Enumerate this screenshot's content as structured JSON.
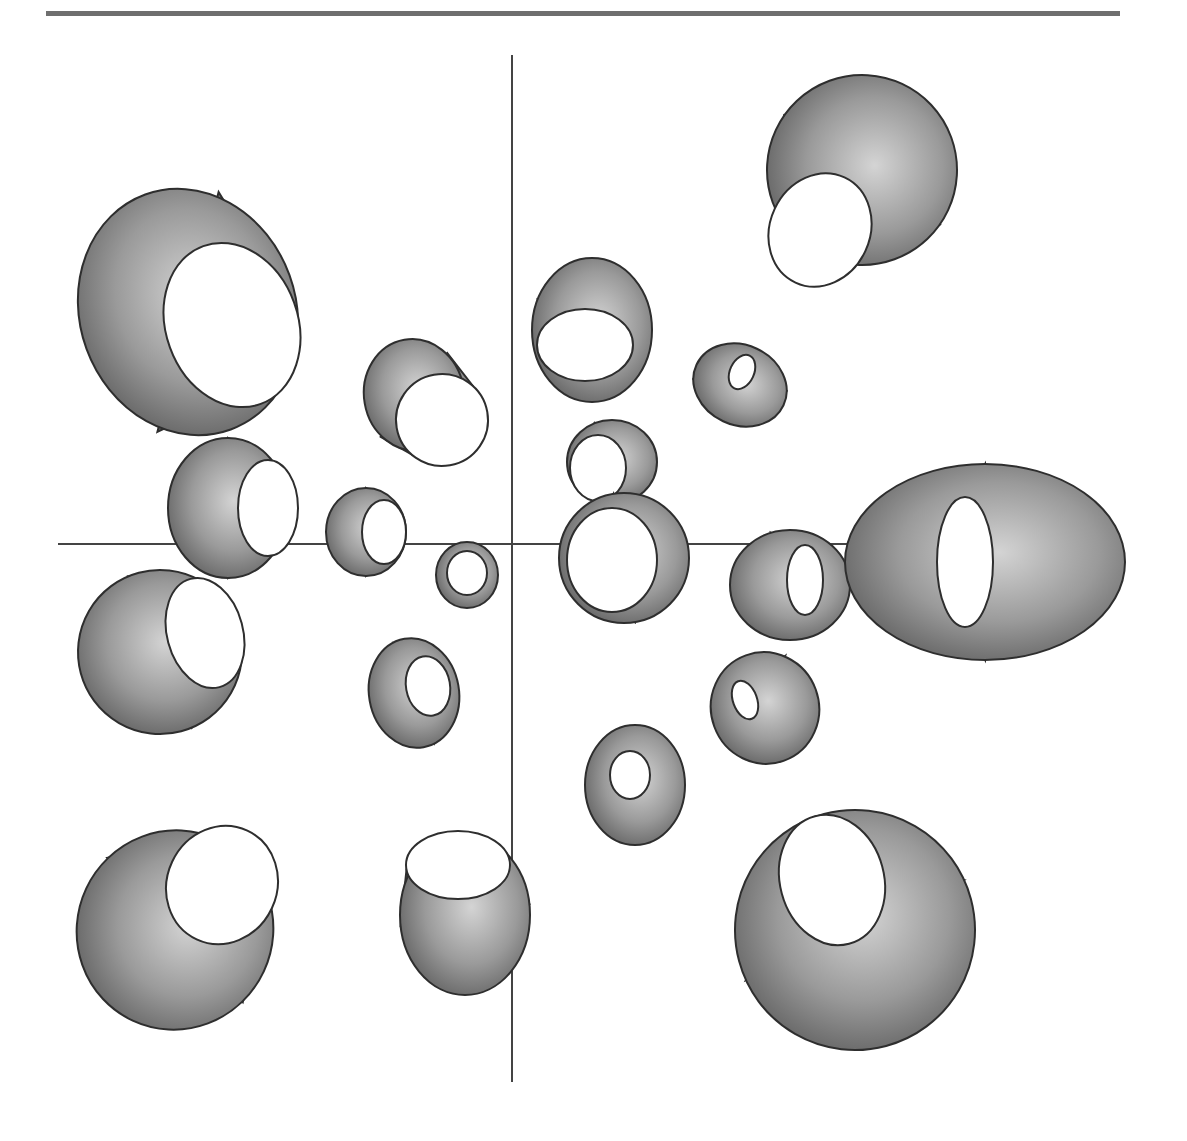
{
  "figure": {
    "width": 1187,
    "height": 1141,
    "background": "#ffffff",
    "stroke_color": "#2e2e2e",
    "hole_color": "#ffffff",
    "shade_light": "#d4d4d4",
    "shade_mid": "#9a9a9a",
    "shade_dark": "#5a5a5a",
    "top_rule": {
      "x": 46,
      "y": 11,
      "width": 1074,
      "height": 5,
      "color": "#6f6f6f"
    },
    "axes": {
      "color": "#444444",
      "vertical": {
        "x": 512,
        "y1": 55,
        "y2": 1082
      },
      "horizontal": {
        "y": 544,
        "x1": 58,
        "x2": 1000
      }
    }
  },
  "tubes": [
    {
      "name": "tube-top-left-large",
      "far": [
        188,
        312,
        108,
        125
      ],
      "near": [
        232,
        325,
        66,
        84
      ],
      "rot": -20
    },
    {
      "name": "tube-upper-left-mid",
      "far": [
        414,
        395,
        50,
        56
      ],
      "near": [
        442,
        420,
        46,
        46
      ],
      "rot": -10
    },
    {
      "name": "tube-left-upper-axis",
      "far": [
        228,
        508,
        60,
        70
      ],
      "near": [
        268,
        508,
        30,
        48
      ],
      "rot": 0
    },
    {
      "name": "tube-left-axis-small",
      "far": [
        366,
        532,
        40,
        44
      ],
      "near": [
        384,
        532,
        22,
        32
      ],
      "rot": 0
    },
    {
      "name": "tube-center-tiny",
      "far": [
        467,
        575,
        31,
        33
      ],
      "near": [
        467,
        573,
        20,
        22
      ],
      "rot": 0
    },
    {
      "name": "tube-left-lower",
      "far": [
        160,
        652,
        82,
        82
      ],
      "near": [
        205,
        633,
        38,
        56
      ],
      "rot": -15
    },
    {
      "name": "tube-lower-left-mid",
      "far": [
        414,
        693,
        45,
        55
      ],
      "near": [
        428,
        686,
        22,
        30
      ],
      "rot": -10
    },
    {
      "name": "tube-bottom-left-large",
      "far": [
        175,
        930,
        98,
        100
      ],
      "near": [
        222,
        885,
        55,
        60
      ],
      "rot": 25
    },
    {
      "name": "tube-bottom-center",
      "far": [
        465,
        915,
        65,
        80
      ],
      "near": [
        458,
        865,
        52,
        34
      ],
      "rot": 0
    },
    {
      "name": "tube-upper-center",
      "far": [
        592,
        330,
        60,
        72
      ],
      "near": [
        585,
        345,
        48,
        36
      ],
      "rot": 0
    },
    {
      "name": "tube-top-right-large",
      "far": [
        862,
        170,
        95,
        95
      ],
      "near": [
        820,
        230,
        50,
        58
      ],
      "rot": 25
    },
    {
      "name": "tube-top-right-small",
      "far": [
        740,
        385,
        48,
        40
      ],
      "near": [
        742,
        372,
        12,
        18
      ],
      "rot": 25
    },
    {
      "name": "tube-center-ring-upper",
      "far": [
        612,
        462,
        45,
        42
      ],
      "near": [
        598,
        468,
        28,
        33
      ],
      "rot": 0
    },
    {
      "name": "tube-center-ring-lower",
      "far": [
        624,
        558,
        65,
        65
      ],
      "near": [
        612,
        560,
        45,
        52
      ],
      "rot": 0
    },
    {
      "name": "tube-right-axis-small",
      "far": [
        790,
        585,
        60,
        55
      ],
      "near": [
        805,
        580,
        18,
        35
      ],
      "rot": 0
    },
    {
      "name": "tube-right-axis-large",
      "far": [
        985,
        562,
        140,
        98
      ],
      "near": [
        965,
        562,
        28,
        65
      ],
      "rot": 0
    },
    {
      "name": "tube-lower-right-small",
      "far": [
        765,
        708,
        54,
        56
      ],
      "near": [
        745,
        700,
        12,
        20
      ],
      "rot": -20
    },
    {
      "name": "tube-lower-center-right",
      "far": [
        635,
        785,
        50,
        60
      ],
      "near": [
        630,
        775,
        20,
        24
      ],
      "rot": 0
    },
    {
      "name": "tube-bottom-right-large",
      "far": [
        855,
        930,
        120,
        120
      ],
      "near": [
        832,
        880,
        52,
        66
      ],
      "rot": -15
    }
  ]
}
